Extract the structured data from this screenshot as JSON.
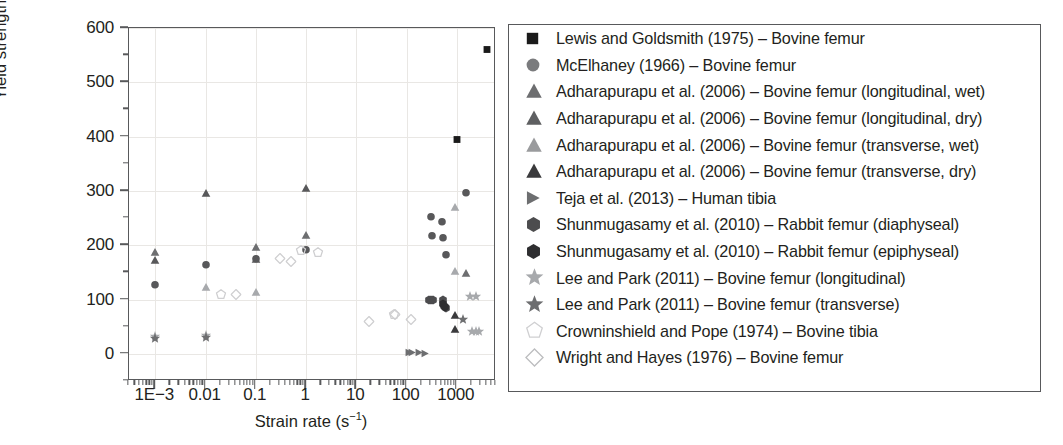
{
  "chart_data": {
    "type": "scatter",
    "title": "",
    "xlabel": "Strain rate (s⁻¹)",
    "ylabel": "Yield strength (MPa)",
    "x_scale": "log",
    "xlim": [
      0.0003,
      6000
    ],
    "ylim": [
      -50,
      600
    ],
    "y_ticks": [
      0,
      100,
      200,
      300,
      400,
      500,
      600
    ],
    "x_ticks": [
      "1E−3",
      "0.01",
      "0.1",
      "1",
      "10",
      "100",
      "1000"
    ],
    "x_tick_values": [
      0.001,
      0.01,
      0.1,
      1,
      10,
      100,
      1000
    ],
    "grid": true,
    "legend_position": "right-outside",
    "series": [
      {
        "name": "Lewis and Goldsmith (1975) – Bovine femur",
        "marker": "square",
        "color": "#1a1a1a",
        "filled": true,
        "points": [
          [
            1000,
            396
          ],
          [
            4000,
            562
          ]
        ]
      },
      {
        "name": "McElhaney (1966) – Bovine femur",
        "marker": "circle",
        "color": "#58585a",
        "filled": true,
        "points": [
          [
            0.001,
            127
          ],
          [
            0.01,
            164
          ],
          [
            0.1,
            175
          ],
          [
            1,
            192
          ],
          [
            300,
            252
          ],
          [
            320,
            218
          ],
          [
            500,
            243
          ],
          [
            520,
            215
          ],
          [
            600,
            183
          ],
          [
            1500,
            297
          ]
        ]
      },
      {
        "name": "Adharapurapu et al. (2006) – Bovine femur (longitudinal, wet)",
        "marker": "triangle",
        "color": "#6d6e70",
        "filled": true,
        "points": [
          [
            0.001,
            188
          ],
          [
            0.1,
            197
          ],
          [
            1,
            219
          ],
          [
            1500,
            148
          ]
        ]
      },
      {
        "name": "Adharapurapu et al. (2006) – Bovine femur (longitudinal, dry)",
        "marker": "triangle",
        "color": "#58585a",
        "filled": true,
        "points": [
          [
            0.001,
            172
          ],
          [
            0.01,
            296
          ],
          [
            0.1,
            175
          ],
          [
            1,
            305
          ]
        ]
      },
      {
        "name": "Adharapurapu et al. (2006) – Bovine femur (transverse, wet)",
        "marker": "triangle",
        "color": "#a7a9ac",
        "filled": true,
        "points": [
          [
            0.01,
            124
          ],
          [
            0.1,
            113
          ],
          [
            900,
            271
          ],
          [
            900,
            153
          ]
        ]
      },
      {
        "name": "Adharapurapu et al. (2006) – Bovine femur (transverse, dry)",
        "marker": "triangle",
        "color": "#3a3a3c",
        "filled": true,
        "points": [
          [
            900,
            72
          ],
          [
            900,
            46
          ]
        ]
      },
      {
        "name": "Teja et al. (2013) – Human tibia",
        "marker": "triangle-right",
        "color": "#6d6e70",
        "filled": true,
        "points": [
          [
            110,
            3
          ],
          [
            130,
            3
          ],
          [
            180,
            3
          ],
          [
            230,
            2
          ]
        ]
      },
      {
        "name": "Shunmugasamy et al. (2010) – Rabbit femur (diaphyseal)",
        "marker": "hexagon",
        "color": "#4c4c4e",
        "filled": true,
        "points": [
          [
            280,
            100
          ],
          [
            300,
            100
          ],
          [
            330,
            100
          ],
          [
            520,
            100
          ],
          [
            560,
            88
          ],
          [
            600,
            84
          ]
        ]
      },
      {
        "name": "Shunmugasamy et al. (2010) – Rabbit femur (epiphyseal)",
        "marker": "hexagon",
        "color": "#2e2e30",
        "filled": true,
        "points": [
          [
            540,
            92
          ],
          [
            580,
            86
          ]
        ]
      },
      {
        "name": "Lee and Park (2011) – Bovine femur (longitudinal)",
        "marker": "star",
        "color": "#a7a9ac",
        "filled": true,
        "points": [
          [
            0.001,
            31
          ],
          [
            0.01,
            32
          ],
          [
            1800,
            104
          ],
          [
            2400,
            104
          ],
          [
            2000,
            40
          ],
          [
            2400,
            40
          ],
          [
            2800,
            40
          ]
        ]
      },
      {
        "name": "Lee and Park (2011) – Bovine femur (transverse)",
        "marker": "star",
        "color": "#6d6e70",
        "filled": true,
        "points": [
          [
            0.001,
            27
          ],
          [
            0.01,
            30
          ],
          [
            1300,
            62
          ]
        ]
      },
      {
        "name": "Crowninshield and Pope (1974) – Bovine tibia",
        "marker": "pentagon-open",
        "color": "#cfcfd1",
        "filled": false,
        "points": [
          [
            0.02,
            108
          ],
          [
            0.8,
            190
          ],
          [
            1.7,
            186
          ],
          [
            55,
            71
          ]
        ]
      },
      {
        "name": "Wright and Hayes (1976) – Bovine femur",
        "marker": "diamond-open",
        "color": "#cfcfd1",
        "filled": false,
        "points": [
          [
            0.04,
            108
          ],
          [
            0.3,
            175
          ],
          [
            0.5,
            170
          ],
          [
            18,
            58
          ],
          [
            60,
            71
          ],
          [
            120,
            63
          ]
        ]
      }
    ]
  },
  "axes": {
    "y_label": "Yield strength (MPa)",
    "x_label_text": "Strain rate (s",
    "x_label_sup": "−1",
    "x_label_close": ")",
    "y_tick_labels": [
      "600",
      "500",
      "400",
      "300",
      "200",
      "100",
      "0"
    ],
    "x_tick_labels": [
      "1E−3",
      "0.01",
      "0.1",
      "1",
      "10",
      "100",
      "1000"
    ]
  },
  "legend": {
    "entries": [
      {
        "label": "Lewis and Goldsmith (1975) – Bovine femur",
        "marker": "square",
        "color": "#1a1a1a"
      },
      {
        "label": "McElhaney (1966) – Bovine femur",
        "marker": "circle",
        "color": "#7a7b7d"
      },
      {
        "label": "Adharapurapu et al. (2006) – Bovine femur (longitudinal, wet)",
        "marker": "triangle",
        "color": "#6d6e70"
      },
      {
        "label": "Adharapurapu et al. (2006) – Bovine femur (longitudinal, dry)",
        "marker": "triangle",
        "color": "#5e5f61"
      },
      {
        "label": "Adharapurapu et al. (2006) – Bovine femur (transverse, wet)",
        "marker": "triangle",
        "color": "#9a9b9d"
      },
      {
        "label": "Adharapurapu et al. (2006) – Bovine femur (transverse, dry)",
        "marker": "triangle",
        "color": "#3a3a3c"
      },
      {
        "label": "Teja et al. (2013) – Human tibia",
        "marker": "triangle-right",
        "color": "#6d6e70"
      },
      {
        "label": "Shunmugasamy et al. (2010) – Rabbit femur (diaphyseal)",
        "marker": "hexagon",
        "color": "#4c4c4e"
      },
      {
        "label": "Shunmugasamy et al. (2010) – Rabbit femur (epiphyseal)",
        "marker": "hexagon",
        "color": "#2e2e30"
      },
      {
        "label": "Lee and Park (2011) – Bovine femur (longitudinal)",
        "marker": "star",
        "color": "#a7a9ac"
      },
      {
        "label": "Lee and Park (2011) – Bovine femur (transverse)",
        "marker": "star",
        "color": "#6d6e70"
      },
      {
        "label": "Crowninshield and Pope (1974) – Bovine tibia",
        "marker": "pentagon-open",
        "color": "#cfcfd1"
      },
      {
        "label": "Wright and Hayes (1976) – Bovine femur",
        "marker": "diamond-open",
        "color": "#bcbdbf"
      }
    ]
  }
}
